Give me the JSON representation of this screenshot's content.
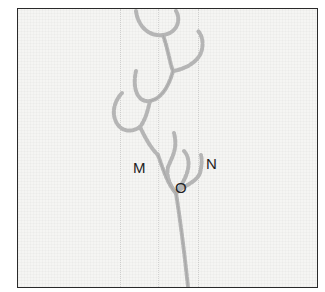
{
  "figure": {
    "labels": [
      {
        "id": "M",
        "text": "M"
      },
      {
        "id": "N",
        "text": "N"
      },
      {
        "id": "O",
        "text": "O"
      }
    ],
    "colors": {
      "frame": "#2a2a2a",
      "fabric": "#f5f5f3",
      "thread": "#b8b8b8"
    }
  }
}
